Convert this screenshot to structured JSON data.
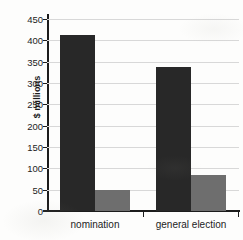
{
  "chart_data": {
    "type": "bar",
    "title": "",
    "xlabel": "",
    "ylabel": "$ millions",
    "categories": [
      "nomination",
      "general election"
    ],
    "series": [
      {
        "name": "dark",
        "color": "#282828",
        "values": [
          412,
          337
        ]
      },
      {
        "name": "gray",
        "color": "#6e6e6e",
        "values": [
          50,
          85
        ]
      }
    ],
    "ylim": [
      0,
      450
    ],
    "ytick_values": [
      0,
      50,
      100,
      150,
      200,
      250,
      300,
      350,
      400,
      450
    ],
    "ytick_labels": [
      "0",
      "50",
      "100",
      "150",
      "200",
      "250",
      "300",
      "350",
      "400",
      "450"
    ],
    "grid": true,
    "legend": "none",
    "annotations": []
  },
  "axes": {
    "y_title": "$ millions"
  }
}
